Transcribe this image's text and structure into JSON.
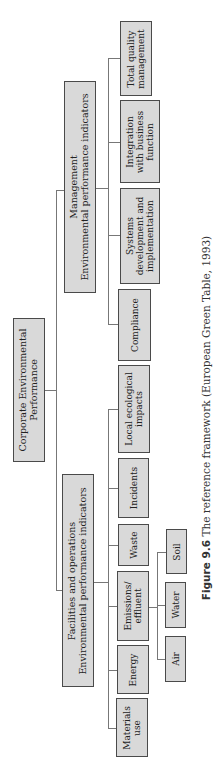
{
  "diagram": {
    "title": "The reference framework",
    "root": {
      "label": "Corporate Environmental\nPerformance"
    },
    "level1": {
      "management": {
        "label": "Management\nEnvironmental performance indicators"
      },
      "facilities": {
        "label": "Facilities and operations\nEnvironmental performance indicators"
      }
    },
    "management_children": [
      {
        "label": "Total quality\nmanagement"
      },
      {
        "label": "Integration\nwith business\nfunction"
      },
      {
        "label": "Systems\ndevelopment and\nimplementation"
      },
      {
        "label": "Compliance"
      }
    ],
    "facilities_children": [
      {
        "label": "Local ecological\nimpacts"
      },
      {
        "label": "Incidents"
      },
      {
        "label": "Waste"
      },
      {
        "label": "Emissions/\neffluent"
      },
      {
        "label": "Energy"
      },
      {
        "label": "Materials\nuse"
      }
    ],
    "emissions_children": [
      {
        "label": "Soil"
      },
      {
        "label": "Water"
      },
      {
        "label": "Air"
      }
    ],
    "colors": {
      "box_fill": "#d9d9d9",
      "box_border": "#4a4a4a",
      "connector": "#777777"
    }
  },
  "caption": {
    "figure_label": "Figure 9.6",
    "text": " The reference framework (European Green Table, 1993)"
  }
}
